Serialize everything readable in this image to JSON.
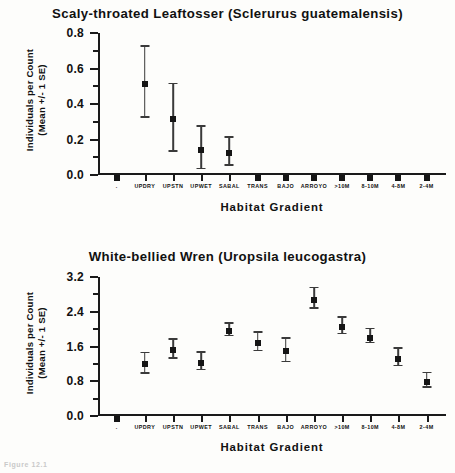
{
  "figure": {
    "caption_fragment": "Figure 12.1",
    "background": "#fdfdfb",
    "ink_color": "#151515"
  },
  "chart_data": [
    {
      "type": "scatter",
      "title": "Scaly-throated Leaftosser (Sclerurus guatemalensis)",
      "xlabel": "Habitat Gradient",
      "ylabel": "Individuals per Count (Mean +/- 1 SE)",
      "ylabel_line1": "Individuals per Count",
      "ylabel_line2": "(Mean +/- 1 SE)",
      "ylim": [
        0.0,
        0.8
      ],
      "ytick_labels": [
        "0.0",
        "0.2",
        "0.4",
        "0.6",
        "0.8"
      ],
      "ytick_values": [
        0.0,
        0.2,
        0.4,
        0.6,
        0.8
      ],
      "yminor_values": [
        0.1,
        0.3,
        0.5,
        0.7
      ],
      "grid": false,
      "legend": "none",
      "categories": [
        "",
        "UPDRY",
        "UPSTN",
        "UPWET",
        "SABAL",
        "TRANS",
        "BAJO",
        "ARROYO",
        ">10M",
        "8-10M",
        "4-8M",
        "2-4M"
      ],
      "values": [
        0.0,
        0.53,
        0.33,
        0.16,
        0.14,
        0.0,
        0.0,
        0.0,
        0.0,
        0.0,
        0.0,
        0.0
      ],
      "err_low": [
        0.0,
        0.2,
        0.19,
        0.12,
        0.08,
        0.0,
        0.0,
        0.0,
        0.0,
        0.0,
        0.0,
        0.0
      ],
      "err_high": [
        0.0,
        0.2,
        0.19,
        0.12,
        0.08,
        0.0,
        0.0,
        0.0,
        0.0,
        0.0,
        0.0,
        0.0
      ]
    },
    {
      "type": "scatter",
      "title": "White-bellied Wren (Uropsila leucogastra)",
      "xlabel": "Habitat Gradient",
      "ylabel": "Individuals per Count (Mean +/- 1 SE)",
      "ylabel_line1": "Individuals per Count",
      "ylabel_line2": "(Mean +/- 1 SE)",
      "ylim": [
        0.0,
        3.2
      ],
      "ytick_labels": [
        "0.0",
        "0.8",
        "1.6",
        "2.4",
        "3.2"
      ],
      "ytick_values": [
        0.0,
        0.8,
        1.6,
        2.4,
        3.2
      ],
      "yminor_values": [
        0.4,
        1.2,
        2.0,
        2.8
      ],
      "grid": false,
      "legend": "none",
      "categories": [
        "",
        "UPDRY",
        "UPSTN",
        "UPWET",
        "SABAL",
        "TRANS",
        "BAJO",
        "ARROYO",
        ">10M",
        "8-10M",
        "4-8M",
        "2-4M"
      ],
      "values": [
        0.0,
        1.27,
        1.58,
        1.3,
        2.02,
        1.75,
        1.56,
        2.74,
        2.11,
        1.87,
        1.39,
        0.86
      ],
      "err_low": [
        0.0,
        0.26,
        0.22,
        0.21,
        0.15,
        0.22,
        0.29,
        0.23,
        0.19,
        0.16,
        0.21,
        0.17
      ],
      "err_high": [
        0.0,
        0.21,
        0.21,
        0.19,
        0.14,
        0.2,
        0.26,
        0.24,
        0.19,
        0.16,
        0.2,
        0.16
      ]
    }
  ]
}
